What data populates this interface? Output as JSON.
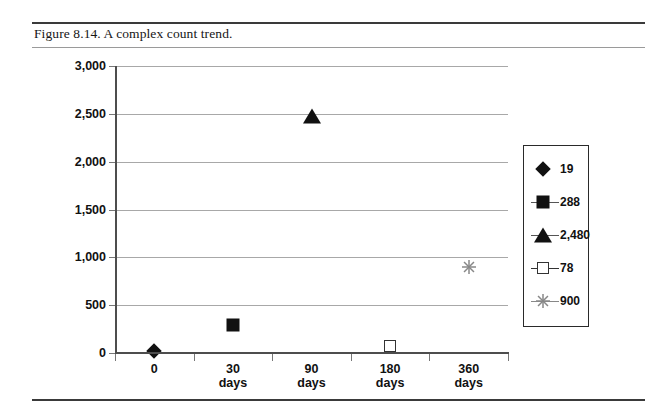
{
  "figure": {
    "caption": "Figure 8.14. A complex count trend."
  },
  "chart_data": {
    "type": "scatter",
    "title": "",
    "xlabel": "",
    "ylabel": "",
    "grid": true,
    "legend_position": "right",
    "ylim": [
      0,
      3000
    ],
    "ytick_labels": [
      "3,000",
      "2,500",
      "2,000",
      "1,500",
      "1,000",
      "500",
      "0"
    ],
    "ytick_values": [
      3000,
      2500,
      2000,
      1500,
      1000,
      500,
      0
    ],
    "categories": [
      "0",
      "30 days",
      "90 days",
      "180 days",
      "360 days"
    ],
    "category_lines": [
      [
        "0",
        ""
      ],
      [
        "30",
        "days"
      ],
      [
        "90",
        "days"
      ],
      [
        "180",
        "days"
      ],
      [
        "360",
        "days"
      ]
    ],
    "series": [
      {
        "name": "19",
        "marker": "filled-diamond",
        "color": "#111111",
        "category": "0",
        "value": 19
      },
      {
        "name": "288",
        "marker": "filled-square",
        "color": "#111111",
        "category": "30 days",
        "value": 288
      },
      {
        "name": "2,480",
        "marker": "filled-triangle",
        "color": "#111111",
        "category": "90 days",
        "value": 2480
      },
      {
        "name": "78",
        "marker": "open-square",
        "color": "#333333",
        "category": "180 days",
        "value": 78
      },
      {
        "name": "900",
        "marker": "asterisk",
        "color": "#888888",
        "category": "360 days",
        "value": 900
      }
    ],
    "legend_entries": [
      "19",
      "288",
      "2,480",
      "78",
      "900"
    ]
  },
  "colors": {
    "marker_fill": "#111111",
    "asterisk": "#888888",
    "gridline": "#a8a8a8",
    "axis": "#4d4d4d",
    "rule": "#3a3a3a"
  }
}
